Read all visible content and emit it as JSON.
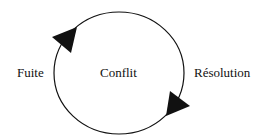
{
  "diagram": {
    "type": "cycle",
    "center_label": "Conflit",
    "left_label": "Fuite",
    "right_label": "Résolution",
    "arrows": [
      {
        "position": "upper-left",
        "direction": "clockwise"
      },
      {
        "position": "lower-right",
        "direction": "clockwise"
      }
    ],
    "colors": {
      "stroke": "#111111",
      "background": "#ffffff"
    }
  }
}
